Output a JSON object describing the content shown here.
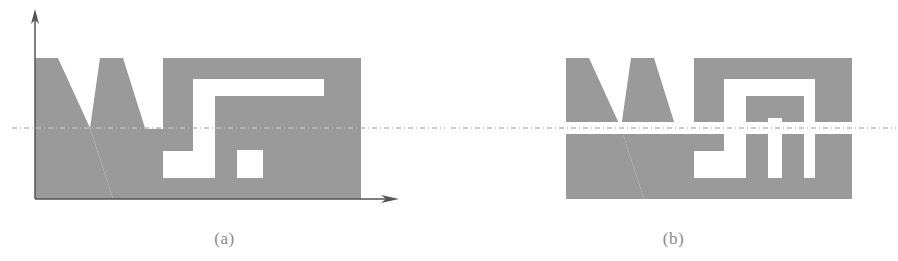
{
  "figure": {
    "width": 898,
    "height": 261,
    "background_color": "#ffffff",
    "shape_fill_color": "#9a9a9a",
    "axis_color": "#555555",
    "dashed_line_color": "#b9b9b9",
    "caption_color": "#8a8a8a"
  },
  "panels": [
    {
      "id": "panel-a",
      "caption": "(a)",
      "description": "Shape with coordinate axes and dash-dot symmetry line",
      "has_axes": true,
      "axis": {
        "origin_x": 35,
        "origin_y": 199,
        "y_arrow_tip_y": 12,
        "x_arrow_tip_x": 399,
        "vertical_arrow_icon": "up-arrow-icon",
        "horizontal_arrow_icon": "right-arrow-icon"
      },
      "symmetry_line": {
        "y": 128,
        "x_start": 12,
        "x_end": 445,
        "style": "dash-dot"
      },
      "shape": {
        "top_y": 58,
        "baseline_y": 199,
        "left_x": 35,
        "right_x": 361
      }
    },
    {
      "id": "panel-b",
      "caption": "(b)",
      "description": "Same shape split along the symmetry line into upper and lower halves with a separating gap",
      "has_axes": false,
      "symmetry_line": {
        "y": 128,
        "x_start": 2,
        "x_end": 447,
        "style": "dash-dot"
      },
      "split": {
        "gap_top_y": 122,
        "gap_bottom_y": 134,
        "upper_top_y": 58,
        "lower_bottom_y": 199,
        "left_x": 117,
        "right_x": 403
      }
    }
  ]
}
